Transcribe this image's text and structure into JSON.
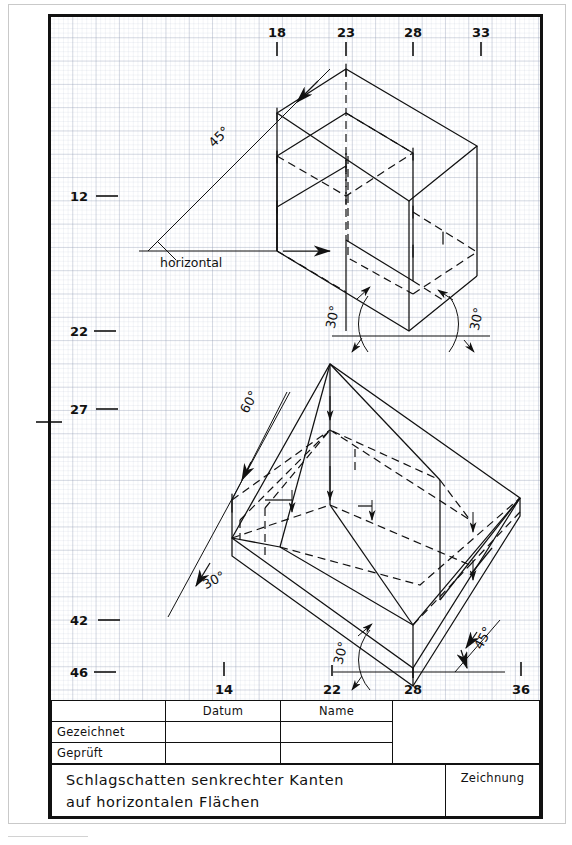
{
  "sheet": {
    "title_main": "Schlagschatten  senkrechter  Kanten",
    "title_sub": "auf  horizontalen  Flächen",
    "drawing_label": "Zeichnung"
  },
  "title_block": {
    "col_headers": [
      "",
      "Datum",
      "Name"
    ],
    "rows": [
      {
        "label": "Gezeichnet",
        "datum": "",
        "name": ""
      },
      {
        "label": "Geprüft",
        "datum": "",
        "name": ""
      }
    ]
  },
  "axes": {
    "top_ticks": [
      {
        "label": "18",
        "x": 277
      },
      {
        "label": "23",
        "x": 346
      },
      {
        "label": "28",
        "x": 413
      },
      {
        "label": "33",
        "x": 481
      }
    ],
    "left_ticks": [
      {
        "label": "12",
        "y": 196
      },
      {
        "label": "22",
        "y": 331
      },
      {
        "label": "27",
        "y": 409
      },
      {
        "label": "42",
        "y": 620
      },
      {
        "label": "46",
        "y": 672
      }
    ],
    "bottom_ticks": [
      {
        "label": "14",
        "x": 224
      },
      {
        "label": "22",
        "x": 332
      },
      {
        "label": "28",
        "x": 413
      },
      {
        "label": "36",
        "x": 521
      }
    ]
  },
  "upper_figure": {
    "name": "upper-shadow-construction",
    "annotations": [
      {
        "text": "45°",
        "kind": "angle-label",
        "x": 222,
        "y": 140
      },
      {
        "text": "horizontal",
        "kind": "axis-label",
        "x": 160,
        "y": 264
      },
      {
        "text": "30°",
        "kind": "angle-label",
        "x": 337,
        "y": 315
      },
      {
        "text": "30°",
        "kind": "angle-label",
        "x": 478,
        "y": 318
      }
    ]
  },
  "lower_figure": {
    "name": "lower-shadow-construction",
    "annotations": [
      {
        "text": "60°",
        "kind": "angle-label",
        "x": 253,
        "y": 404
      },
      {
        "text": "30°",
        "kind": "angle-label",
        "x": 216,
        "y": 581
      },
      {
        "text": "30°",
        "kind": "angle-label",
        "x": 348,
        "y": 651
      },
      {
        "text": "45°",
        "kind": "angle-label",
        "x": 482,
        "y": 637
      }
    ]
  },
  "colors": {
    "ink": "#111111",
    "grid": "#8c96af",
    "paper": "#ffffff"
  }
}
